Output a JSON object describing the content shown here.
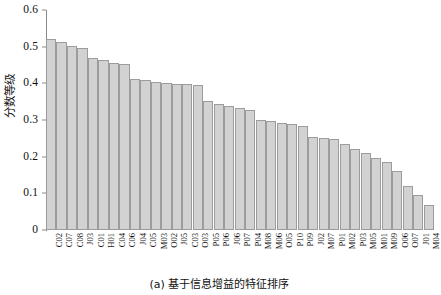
{
  "caption": "(a) 基于信息增益的特征排序",
  "chart_data": {
    "type": "bar",
    "title": "",
    "subtitle": "",
    "xlabel": "",
    "ylabel": "分数等级",
    "ylim": [
      0,
      0.6
    ],
    "ytick_labels": [
      "0",
      "0.1",
      "0.2",
      "0.3",
      "0.4",
      "0.5",
      "0.6"
    ],
    "ytick_values": [
      0,
      0.1,
      0.2,
      0.3,
      0.4,
      0.5,
      0.6
    ],
    "grid": false,
    "legend": null,
    "bar_fill": "#d2d2d2",
    "bar_edge": "#9c9c9c",
    "axis_color": "#8a8a8a",
    "categories": [
      "C02",
      "C07",
      "C08",
      "J03",
      "C01",
      "H01",
      "C04",
      "C06",
      "J04",
      "C05",
      "M03",
      "O02",
      "J05",
      "C03",
      "O03",
      "P05",
      "P06",
      "J06",
      "P07",
      "P04",
      "M08",
      "M06",
      "O05",
      "P10",
      "P09",
      "J02",
      "M07",
      "P01",
      "M02",
      "P03",
      "M05",
      "M01",
      "M09",
      "O06",
      "O07",
      "J01",
      "M04"
    ],
    "values": [
      0.521,
      0.512,
      0.501,
      0.497,
      0.468,
      0.463,
      0.456,
      0.452,
      0.412,
      0.408,
      0.404,
      0.402,
      0.399,
      0.397,
      0.396,
      0.352,
      0.343,
      0.339,
      0.333,
      0.327,
      0.3,
      0.296,
      0.292,
      0.288,
      0.285,
      0.255,
      0.251,
      0.248,
      0.235,
      0.22,
      0.209,
      0.196,
      0.185,
      0.16,
      0.12,
      0.096,
      0.068
    ]
  }
}
